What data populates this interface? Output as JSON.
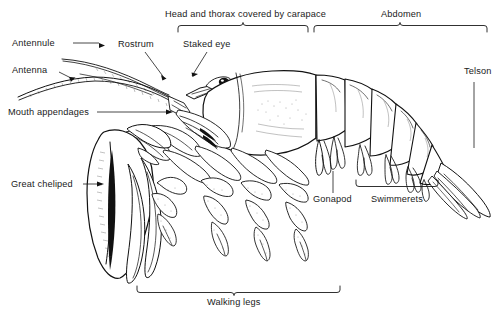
{
  "figure": {
    "background_color": "#ffffff",
    "ink_color": "#111111",
    "width": 498,
    "height": 314
  },
  "labels": {
    "antennule": "Antennule",
    "antenna": "Antenna",
    "mouth_appendages": "Mouth appendages",
    "great_cheliped": "Great cheliped",
    "rostrum": "Rostrum",
    "staked_eye": "Staked eye",
    "head_thorax": "Head and thorax covered by carapace",
    "abdomen": "Abdomen",
    "telson": "Telson",
    "gonapod": "Gonapod",
    "swimmerets": "Swimmerets",
    "walking_legs": "Walking legs"
  }
}
